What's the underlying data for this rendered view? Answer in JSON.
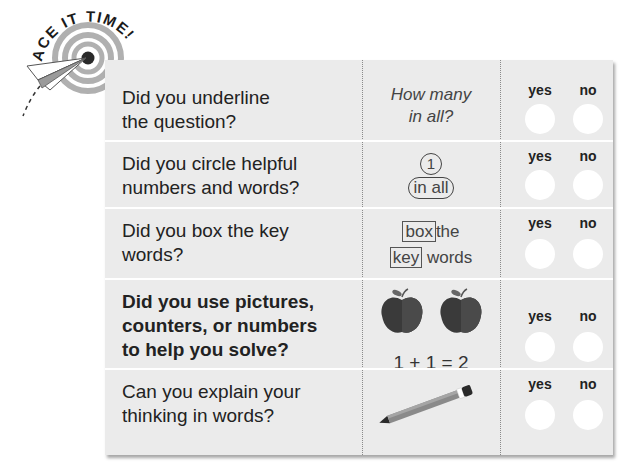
{
  "badge": {
    "title": "ACE IT TIME!",
    "icons": [
      "target-icon",
      "paper-airplane-icon"
    ]
  },
  "checklist": {
    "columns": [
      "question",
      "example",
      "answer"
    ],
    "answer_labels": {
      "yes": "yes",
      "no": "no"
    },
    "rows": [
      {
        "question": [
          "Did you underline",
          "the question?"
        ],
        "bold": false,
        "example": {
          "type": "italic-text",
          "lines": [
            "How many",
            "in all?"
          ]
        }
      },
      {
        "question": [
          "Did you circle helpful",
          "numbers and words?"
        ],
        "bold": false,
        "example": {
          "type": "circled",
          "number": "1",
          "phrase": "in all"
        }
      },
      {
        "question": [
          "Did you box the key",
          "words?"
        ],
        "bold": false,
        "example": {
          "type": "boxed",
          "line1_box": "box",
          "line1_rest": "the",
          "line2_box": "key",
          "line2_rest": "words"
        }
      },
      {
        "question": [
          "Did you use pictures,",
          "counters, or numbers",
          "to help you solve?"
        ],
        "bold": true,
        "example": {
          "type": "apples",
          "icons": [
            "apple-icon",
            "apple-icon"
          ],
          "equation": "1 + 1 = 2"
        }
      },
      {
        "question": [
          "Can you explain your",
          "thinking in words?"
        ],
        "bold": false,
        "example": {
          "type": "icon",
          "icon": "pencil-icon"
        }
      }
    ]
  },
  "colors": {
    "card_bg": "#ebebeb",
    "separator": "#ffffff",
    "text": "#222222",
    "target_gray": "#a8a8a8",
    "target_center": "#2a2a2a",
    "apple": "#3a3a3a"
  }
}
